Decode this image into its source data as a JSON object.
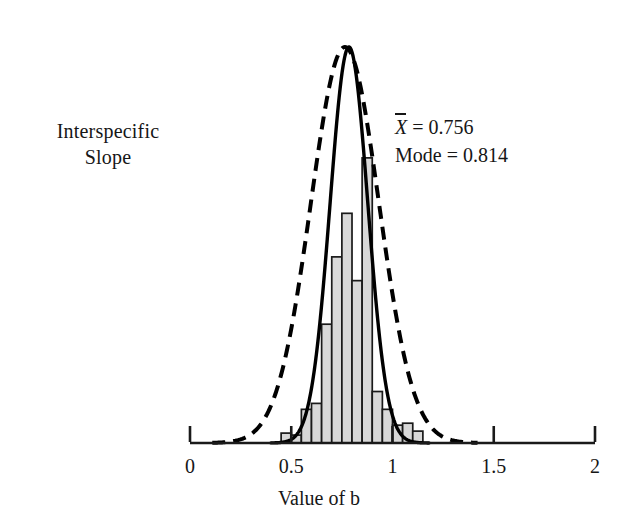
{
  "figure": {
    "y_axis_caption_lines": [
      "Interspecific",
      "Slope"
    ],
    "x_axis_title": "Value of b",
    "stats": {
      "mean_symbol": "X",
      "mean_text": " = 0.756",
      "mode_text": "Mode = 0.814"
    }
  },
  "chart_data": {
    "type": "bar",
    "title": "",
    "subtitle": "",
    "xlabel": "Value of b",
    "ylabel": "Interspecific Slope",
    "xlim": [
      0,
      2
    ],
    "ylim": [
      0,
      1.0
    ],
    "grid": false,
    "legend": "none",
    "x_ticks": [
      0,
      0.5,
      1,
      1.5,
      2
    ],
    "x_tick_labels": [
      "0",
      "0.5",
      "1",
      "1.5",
      "2"
    ],
    "y_ticks": [],
    "y_tick_labels": [],
    "annotations": [
      {
        "text": "X̄ = 0.756",
        "x": 1.02,
        "y": 0.86
      },
      {
        "text": "Mode = 0.814",
        "x": 1.02,
        "y": 0.79
      }
    ],
    "bin_width": 0.05,
    "bin_left_edges": [
      0.45,
      0.5,
      0.55,
      0.6,
      0.65,
      0.7,
      0.75,
      0.8,
      0.85,
      0.9,
      0.95,
      1.0,
      1.05,
      1.1
    ],
    "bin_centers": [
      0.475,
      0.525,
      0.575,
      0.625,
      0.675,
      0.725,
      0.775,
      0.825,
      0.875,
      0.925,
      0.975,
      1.025,
      1.075,
      1.125
    ],
    "categories": [
      "0.45-0.50",
      "0.50-0.55",
      "0.55-0.60",
      "0.60-0.65",
      "0.65-0.70",
      "0.70-0.75",
      "0.75-0.80",
      "0.80-0.85",
      "0.85-0.90",
      "0.90-0.95",
      "0.95-1.00",
      "1.00-1.05",
      "1.05-1.10",
      "1.10-1.15"
    ],
    "values": [
      0.025,
      0.02,
      0.085,
      0.1,
      0.3,
      0.47,
      0.58,
      0.41,
      0.72,
      0.13,
      0.085,
      0.045,
      0.05,
      0.03
    ],
    "bar_face_color": "#d8d8d8",
    "bar_edge_color": "#1a1a1a",
    "curves": [
      {
        "name": "solid-normal-curve",
        "style": "solid",
        "color": "#000000",
        "mean": 0.785,
        "sigma": 0.093,
        "peak_height": 1.0,
        "x_start": 0.4,
        "x_end": 1.18
      },
      {
        "name": "dashed-normal-curve",
        "style": "dashed",
        "color": "#000000",
        "mean": 0.765,
        "sigma": 0.168,
        "peak_height": 1.0,
        "x_start": 0.11,
        "x_end": 1.42
      }
    ]
  }
}
